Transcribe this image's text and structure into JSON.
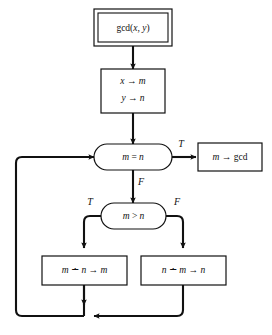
{
  "diagram": {
    "colors": {
      "background": "#ffffff",
      "stroke": "#111111",
      "fill": "#ffffff"
    },
    "nodes": {
      "start": {
        "label": "gcd(x, y)",
        "shape": "double-rectangle",
        "role": "entry-point"
      },
      "init": {
        "line1": "x → m",
        "line2": "y → n",
        "shape": "rectangle",
        "role": "assignment"
      },
      "equality_test": {
        "label": "m = n",
        "shape": "stadium",
        "role": "decision"
      },
      "output": {
        "label": "m → gcd",
        "shape": "rectangle",
        "role": "output"
      },
      "greater_test": {
        "label": "m > n",
        "shape": "stadium",
        "role": "decision"
      },
      "subtract_left": {
        "label": "m ∸ n → m",
        "shape": "rectangle",
        "role": "assignment"
      },
      "subtract_right": {
        "label": "n ∸ m → n",
        "shape": "rectangle",
        "role": "assignment"
      }
    },
    "branch_labels": {
      "equality_true": "T",
      "equality_false": "F",
      "greater_true": "T",
      "greater_false": "F"
    },
    "edges": [
      {
        "name": "start-to-init",
        "from": "start",
        "to": "init",
        "label": ""
      },
      {
        "name": "init-to-equality",
        "from": "init",
        "to": "equality_test",
        "label": ""
      },
      {
        "name": "equality-true-to-output",
        "from": "equality_test",
        "to": "output",
        "label": "T"
      },
      {
        "name": "equality-false-to-greater",
        "from": "equality_test",
        "to": "greater_test",
        "label": "F"
      },
      {
        "name": "greater-true-to-subtract-left",
        "from": "greater_test",
        "to": "subtract_left",
        "label": "T"
      },
      {
        "name": "greater-false-to-subtract-right",
        "from": "greater_test",
        "to": "subtract_right",
        "label": "F"
      },
      {
        "name": "subtract-left-to-join",
        "from": "subtract_left",
        "to": "loop_join",
        "label": ""
      },
      {
        "name": "subtract-right-to-join",
        "from": "subtract_right",
        "to": "loop_join",
        "label": ""
      },
      {
        "name": "loop-back-to-equality",
        "from": "loop_join",
        "to": "equality_test",
        "label": ""
      }
    ]
  }
}
